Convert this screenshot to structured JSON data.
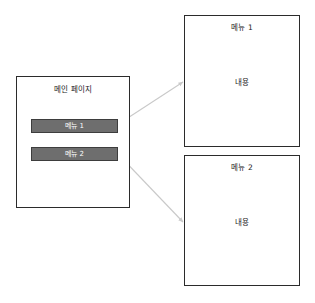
{
  "diagram": {
    "title": "",
    "background_color": "#ffffff",
    "line_color": "#2b2b2b",
    "connector_color": "#c9c9c9",
    "button_fill_color": "#6e6e6e",
    "button_border_color": "#3d3d3d",
    "button_text_color": "#fdfdfd"
  },
  "main_page": {
    "title": "메인 페이지",
    "buttons": [
      {
        "label": "메뉴 1"
      },
      {
        "label": "메뉴 2"
      }
    ]
  },
  "content_pages": [
    {
      "title": "메뉴 1",
      "body": "내용"
    },
    {
      "title": "메뉴 2",
      "body": "내용"
    }
  ],
  "connectors": [
    {
      "from": "메뉴 1",
      "to": "메뉴 1"
    },
    {
      "from": "메뉴 2",
      "to": "메뉴 2"
    }
  ]
}
